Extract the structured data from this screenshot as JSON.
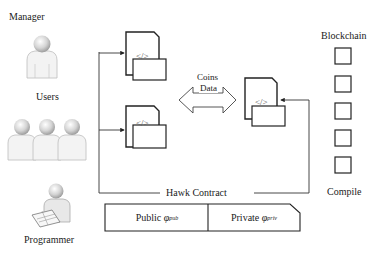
{
  "actors": {
    "manager": {
      "label": "Manager",
      "icon": "person-icon"
    },
    "users": {
      "label": "Users",
      "icon": "group-icon"
    },
    "programmer": {
      "label": "Programmer",
      "icon": "programmer-at-laptop-icon"
    }
  },
  "contracts": {
    "code_glyph": "</>",
    "exchange": {
      "line1": "Coins",
      "line2": "Data",
      "icon": "double-arrow-icon"
    }
  },
  "blockchain": {
    "label": "Blockchain",
    "block_count": 5,
    "compile_label": "Compile"
  },
  "hawk": {
    "label": "Hawk Contract",
    "public": {
      "label": "Public",
      "symbol": "φ",
      "subscript": "pub"
    },
    "private": {
      "label": "Private",
      "symbol": "φ",
      "subscript": "priv"
    }
  },
  "colors": {
    "line": "#333333",
    "box": "#222222",
    "person_fill": "#e6e6e6",
    "person_stroke": "#b5b5b5"
  }
}
